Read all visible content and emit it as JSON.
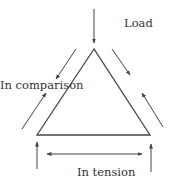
{
  "diagram": {
    "labels": {
      "load": "Load",
      "compression": "In comparison",
      "tension": "In tension"
    },
    "colors": {
      "line": "#444444",
      "text": "#333333",
      "background": "#ffffff"
    }
  }
}
